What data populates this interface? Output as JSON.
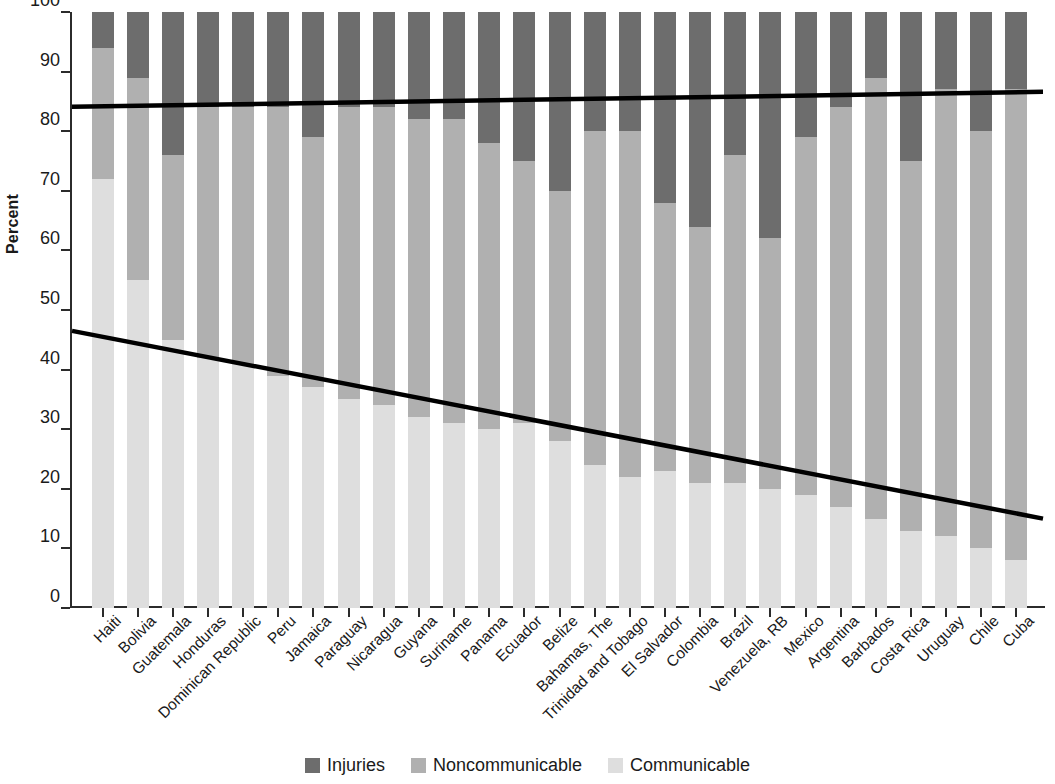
{
  "chart_data": {
    "type": "bar",
    "stacked": true,
    "title": "",
    "subtitle": "",
    "xlabel": "",
    "ylabel": "Percent",
    "ylim": [
      0,
      100
    ],
    "ytick_labels": [
      "0",
      "10",
      "20",
      "30",
      "40",
      "50",
      "60",
      "70",
      "80",
      "90",
      "100"
    ],
    "ytick_values": [
      0,
      10,
      20,
      30,
      40,
      50,
      60,
      70,
      80,
      90,
      100
    ],
    "grid": false,
    "legend_position": "bottom-center",
    "categories": [
      "Haiti",
      "Bolivia",
      "Guatemala",
      "Honduras",
      "Dominican Republic",
      "Peru",
      "Jamaica",
      "Paraguay",
      "Nicaragua",
      "Guyana",
      "Suriname",
      "Panama",
      "Ecuador",
      "Belize",
      "Bahamas, The",
      "Trinidad and Tobago",
      "El Salvador",
      "Colombia",
      "Brazil",
      "Venezuela, RB",
      "Mexico",
      "Argentina",
      "Barbados",
      "Costa Rica",
      "Uruguay",
      "Chile",
      "Cuba"
    ],
    "series": [
      {
        "name": "Communicable",
        "color": "#dedede",
        "values": [
          72,
          55,
          45,
          42,
          41,
          39,
          37,
          35,
          34,
          32,
          31,
          30,
          31,
          28,
          24,
          22,
          23,
          21,
          21,
          20,
          19,
          17,
          15,
          13,
          12,
          10,
          8
        ]
      },
      {
        "name": "Noncommunicable",
        "color": "#b0b0b0",
        "values": [
          22,
          34,
          31,
          42,
          43,
          45,
          42,
          49,
          50,
          50,
          51,
          48,
          44,
          42,
          56,
          58,
          45,
          43,
          55,
          42,
          60,
          67,
          74,
          62,
          75,
          70,
          79
        ]
      },
      {
        "name": "Injuries",
        "color": "#6d6d6d",
        "values": [
          6,
          11,
          24,
          16,
          16,
          16,
          21,
          16,
          16,
          18,
          18,
          22,
          25,
          30,
          20,
          20,
          32,
          36,
          24,
          38,
          21,
          16,
          11,
          25,
          13,
          20,
          13
        ]
      }
    ],
    "segment_tops": {
      "communicable_top": [
        72,
        55,
        45,
        42,
        41,
        39,
        37,
        35,
        34,
        32,
        31,
        30,
        31,
        28,
        24,
        22,
        23,
        21,
        21,
        20,
        19,
        17,
        15,
        13,
        12,
        10,
        8
      ],
      "noncommunicable_top": [
        94,
        89,
        76,
        84,
        84,
        84,
        79,
        84,
        84,
        82,
        82,
        78,
        75,
        70,
        80,
        80,
        68,
        64,
        76,
        62,
        79,
        84,
        89,
        75,
        87,
        80,
        87
      ]
    },
    "trend_lines": [
      {
        "name": "Noncommunicable + Communicable trend",
        "color": "#000000",
        "x_start": 0,
        "x_end": 26,
        "y_start": 84.1,
        "y_end": 86.6
      },
      {
        "name": "Communicable trend",
        "color": "#000000",
        "x_start": 0,
        "x_end": 26,
        "y_start": 46.5,
        "y_end": 15.0
      }
    ],
    "legend": [
      {
        "label": "Injuries",
        "color": "#6d6d6d",
        "icon": "legend-swatch-icon"
      },
      {
        "label": "Noncommunicable",
        "color": "#b0b0b0",
        "icon": "legend-swatch-icon"
      },
      {
        "label": "Communicable",
        "color": "#dedede",
        "icon": "legend-swatch-icon"
      }
    ]
  }
}
